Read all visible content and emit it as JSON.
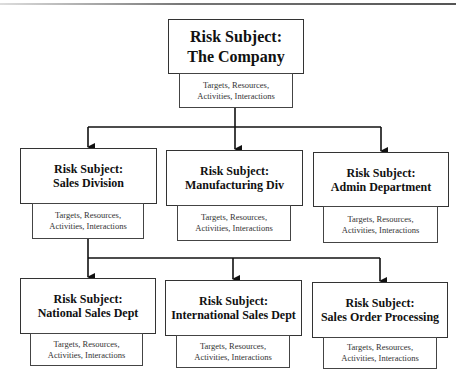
{
  "diagram": {
    "type": "hierarchy",
    "root": {
      "title": "Risk Subject:",
      "name": "The Company",
      "details": [
        "Targets, Resources,",
        "Activities, Interactions"
      ]
    },
    "level2": [
      {
        "title": "Risk Subject:",
        "name": "Sales Division",
        "details": [
          "Targets, Resources,",
          "Activities, Interactions"
        ]
      },
      {
        "title": "Risk Subject:",
        "name": "Manufacturing Div",
        "details": [
          "Targets, Resources,",
          "Activities, Interactions"
        ]
      },
      {
        "title": "Risk Subject:",
        "name": "Admin Department",
        "details": [
          "Targets, Resources,",
          "Activities, Interactions"
        ]
      }
    ],
    "level3": [
      {
        "title": "Risk Subject:",
        "name": "National Sales Dept",
        "details": [
          "Targets, Resources,",
          "Activities, Interactions"
        ]
      },
      {
        "title": "Risk Subject:",
        "name": "International Sales Dept",
        "details": [
          "Targets, Resources,",
          "Activities, Interactions"
        ]
      },
      {
        "title": "Risk Subject:",
        "name": "Sales Order Processing",
        "details": [
          "Targets, Resources,",
          "Activities, Interactions"
        ]
      }
    ],
    "edges": [
      [
        "The Company",
        "Sales Division"
      ],
      [
        "The Company",
        "Manufacturing Div"
      ],
      [
        "The Company",
        "Admin Department"
      ],
      [
        "Sales Division",
        "National Sales Dept"
      ],
      [
        "Sales Division",
        "International Sales Dept"
      ],
      [
        "Sales Division",
        "Sales Order Processing"
      ]
    ]
  }
}
